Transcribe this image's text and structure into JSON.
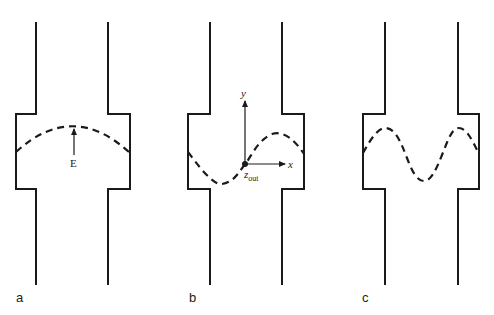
{
  "figure": {
    "panels": [
      {
        "id": "a",
        "label": "a",
        "mode": "half-wave (fundamental)",
        "annotation": "E"
      },
      {
        "id": "b",
        "label": "b",
        "mode": "one full wave (antisymmetric)",
        "axes": {
          "x": "x",
          "y": "y",
          "z": "z",
          "z_subscript": "out"
        }
      },
      {
        "id": "c",
        "label": "c",
        "mode": "one and a half waves"
      }
    ],
    "colors": {
      "line": "#1a1a1a",
      "background": "#ffffff"
    }
  }
}
